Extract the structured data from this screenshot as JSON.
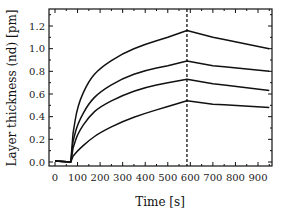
{
  "chart_data": {
    "type": "line",
    "title": "",
    "xlabel": "Time [s]",
    "ylabel": "Layer thickness (nd) [pm]",
    "xlim": [
      -20,
      970
    ],
    "ylim": [
      -0.04,
      1.36
    ],
    "x_ticks": [
      0,
      100,
      200,
      300,
      400,
      500,
      600,
      700,
      800,
      900
    ],
    "x_tick_labels": [
      "0",
      "100",
      "200",
      "300",
      "400",
      "500",
      "600",
      "700",
      "800",
      "900"
    ],
    "y_ticks": [
      0.0,
      0.2,
      0.4,
      0.6,
      0.8,
      1.0,
      1.2
    ],
    "y_tick_labels": [
      "0.0",
      "0.2",
      "0.4",
      "0.6",
      "0.8",
      "1.0",
      "1.2"
    ],
    "grid": false,
    "legend": null,
    "annotations": [
      {
        "type": "vertical-dashed-line",
        "x": 585,
        "description": "switch from association to dissociation"
      }
    ],
    "x": [
      0,
      70,
      80,
      100,
      150,
      200,
      300,
      400,
      500,
      585,
      700,
      800,
      950
    ],
    "series": [
      {
        "name": "curve-1",
        "values": [
          0.01,
          0.0,
          0.25,
          0.5,
          0.72,
          0.83,
          0.96,
          1.04,
          1.1,
          1.16,
          1.1,
          1.06,
          1.0
        ]
      },
      {
        "name": "curve-2",
        "values": [
          0.01,
          0.0,
          0.18,
          0.34,
          0.52,
          0.62,
          0.74,
          0.81,
          0.85,
          0.89,
          0.85,
          0.83,
          0.8
        ]
      },
      {
        "name": "curve-3",
        "values": [
          0.01,
          0.0,
          0.12,
          0.25,
          0.4,
          0.49,
          0.59,
          0.66,
          0.7,
          0.73,
          0.69,
          0.67,
          0.63
        ]
      },
      {
        "name": "curve-4",
        "values": [
          0.01,
          0.0,
          0.05,
          0.1,
          0.19,
          0.26,
          0.36,
          0.43,
          0.49,
          0.54,
          0.51,
          0.5,
          0.48
        ]
      }
    ]
  }
}
